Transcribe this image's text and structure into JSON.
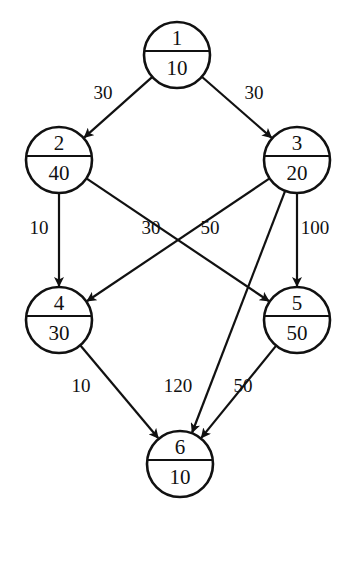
{
  "diagram": {
    "type": "directed-acyclic-graph",
    "colors": {
      "stroke": "#111111",
      "background": "#ffffff"
    },
    "nodes": [
      {
        "id": "1",
        "weight": "10",
        "cx": 177,
        "cy": 55
      },
      {
        "id": "2",
        "weight": "40",
        "cx": 59,
        "cy": 160
      },
      {
        "id": "3",
        "weight": "20",
        "cx": 297,
        "cy": 160
      },
      {
        "id": "4",
        "weight": "30",
        "cx": 59,
        "cy": 320
      },
      {
        "id": "5",
        "weight": "50",
        "cx": 297,
        "cy": 320
      },
      {
        "id": "6",
        "weight": "10",
        "cx": 180,
        "cy": 464
      }
    ],
    "edges": [
      {
        "from": "1",
        "to": "2",
        "label": "30",
        "lx": 103,
        "ly": 99
      },
      {
        "from": "1",
        "to": "3",
        "label": "30",
        "lx": 254,
        "ly": 99
      },
      {
        "from": "2",
        "to": "4",
        "label": "10",
        "lx": 39,
        "ly": 234
      },
      {
        "from": "2",
        "to": "5",
        "label": "30",
        "lx": 151,
        "ly": 234
      },
      {
        "from": "3",
        "to": "4",
        "label": "50",
        "lx": 210,
        "ly": 234
      },
      {
        "from": "3",
        "to": "5",
        "label": "100",
        "lx": 315,
        "ly": 234
      },
      {
        "from": "3",
        "to": "6",
        "label": "120",
        "lx": 178,
        "ly": 392
      },
      {
        "from": "4",
        "to": "6",
        "label": "10",
        "lx": 81,
        "ly": 392
      },
      {
        "from": "5",
        "to": "6",
        "label": "50",
        "lx": 243,
        "ly": 392
      }
    ]
  }
}
